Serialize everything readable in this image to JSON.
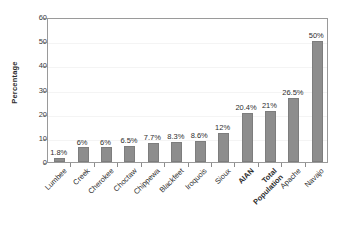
{
  "chart_data": {
    "type": "bar",
    "title": "",
    "xlabel": "",
    "ylabel": "Percentage",
    "ylim": [
      0,
      60
    ],
    "yticks": [
      0,
      10,
      20,
      30,
      40,
      50,
      60
    ],
    "grid": true,
    "legend": "none",
    "categories": [
      "Lumbee",
      "Creek",
      "Cherokee",
      "Choctaw",
      "Chippewa",
      "Blackfeet",
      "Iroquois",
      "Sioux",
      "AIAN",
      "Total Population",
      "Apache",
      "Navajo"
    ],
    "values": [
      1.8,
      6,
      6,
      6.5,
      7.7,
      8.3,
      8.6,
      12,
      20.4,
      21,
      26.5,
      50
    ],
    "data_labels": [
      "1.8%",
      "6%",
      "6%",
      "6.5%",
      "7.7%",
      "8.3%",
      "8.6%",
      "12%",
      "20.4%",
      "21%",
      "26.5%",
      "50%"
    ],
    "emphasized_categories": [
      "AIAN",
      "Total Population"
    ],
    "bar_color": "#8d8d8d",
    "axis_color": "#9a9a9a",
    "text_color": "#2e2e2e"
  },
  "axis": {
    "y_title": "Percentage",
    "y_tick_labels": [
      "0",
      "10",
      "20",
      "30",
      "40",
      "50",
      "60"
    ]
  }
}
